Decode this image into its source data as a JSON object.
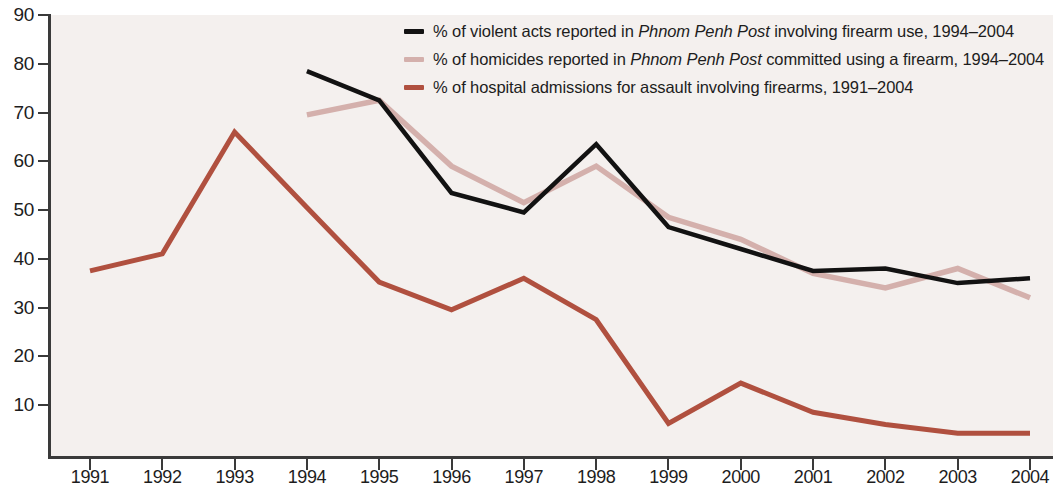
{
  "chart_data": {
    "type": "line",
    "title": "",
    "subtitle": "",
    "xlabel": "",
    "ylabel": "",
    "grid": false,
    "legend_position": "top-right",
    "x": [
      1991,
      1992,
      1993,
      1994,
      1995,
      1996,
      1997,
      1998,
      1999,
      2000,
      2001,
      2002,
      2003,
      2004
    ],
    "x_tick_labels": [
      "1991",
      "1992",
      "1993",
      "1994",
      "1995",
      "1996",
      "1997",
      "1998",
      "1999",
      "2000",
      "2001",
      "2002",
      "2003",
      "2004"
    ],
    "y_tick_labels": [
      "90",
      "80",
      "70",
      "60",
      "50",
      "40",
      "30",
      "20",
      "10"
    ],
    "y_ticks": [
      90,
      80,
      70,
      60,
      50,
      40,
      30,
      20,
      10
    ],
    "ylim": [
      0,
      90
    ],
    "xlim": [
      1991,
      2004
    ],
    "series": [
      {
        "name": "% of violent acts reported in Phnom Penh Post involving firearm use, 1994–2004",
        "name_plain": "% of violent acts reported in ",
        "name_italic": "Phnom Penh Post",
        "name_tail": " involving firearm use, 1994–2004",
        "color": "#121212",
        "x": [
          1994,
          1995,
          1996,
          1997,
          1998,
          1999,
          2000,
          2001,
          2002,
          2003,
          2004
        ],
        "values": [
          78.5,
          72.5,
          53.5,
          49.5,
          63.5,
          46.5,
          42.0,
          37.5,
          38.0,
          35.0,
          36.0
        ]
      },
      {
        "name": "% of homicides reported in Phnom Penh Post committed using a firearm, 1994–2004",
        "name_plain": "% of homicides reported in ",
        "name_italic": "Phnom Penh Post",
        "name_tail": " committed using a firearm, 1994–2004",
        "color": "#d4b0ac",
        "x": [
          1994,
          1995,
          1996,
          1997,
          1998,
          1999,
          2000,
          2001,
          2002,
          2003,
          2004
        ],
        "values": [
          69.5,
          72.5,
          59.0,
          51.5,
          59.0,
          48.5,
          44.0,
          37.0,
          34.0,
          38.0,
          32.0
        ]
      },
      {
        "name": "% of hospital admissions for assault involving firearms, 1991–2004",
        "name_plain": "% of hospital admissions for assault involving firearms, 1991–2004",
        "name_italic": "",
        "name_tail": "",
        "color": "#b0503f",
        "x": [
          1991,
          1992,
          1993,
          1994,
          1995,
          1996,
          1997,
          1998,
          1999,
          2000,
          2001,
          2002,
          2003,
          2004
        ],
        "values": [
          37.5,
          41.0,
          66.0,
          50.5,
          35.2,
          29.5,
          36.0,
          27.5,
          6.2,
          14.5,
          8.5,
          6.0,
          4.2,
          4.2
        ]
      }
    ],
    "colors": {
      "plot_background": "#f4f0ee",
      "axis": "#3a3a3a",
      "text": "#1d1d1d",
      "series_black": "#121212",
      "series_pink": "#d4b0ac",
      "series_red": "#b0503f"
    }
  }
}
